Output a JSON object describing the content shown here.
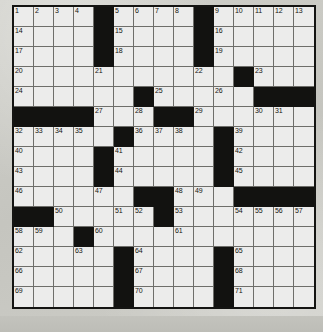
{
  "document": {
    "type": "crossword-puzzle-grid",
    "title": "Crossword Puzzle",
    "caption": ""
  },
  "grid": {
    "columns": 15,
    "rows": 15,
    "cell_size_px": 20,
    "colors": {
      "white_cell": "#ececeb",
      "black_cell": "#121210",
      "grid_line": "#6e6e6a",
      "border": "#141412",
      "number_text": "#15150f",
      "paper_background": "#c8c8c2"
    },
    "black_cells": [
      [
        0,
        4
      ],
      [
        0,
        9
      ],
      [
        1,
        4
      ],
      [
        1,
        9
      ],
      [
        2,
        4
      ],
      [
        2,
        9
      ],
      [
        3,
        11
      ],
      [
        4,
        6
      ],
      [
        4,
        12
      ],
      [
        4,
        13
      ],
      [
        4,
        14
      ],
      [
        5,
        0
      ],
      [
        5,
        1
      ],
      [
        5,
        2
      ],
      [
        5,
        3
      ],
      [
        5,
        7
      ],
      [
        5,
        8
      ],
      [
        6,
        5
      ],
      [
        6,
        10
      ],
      [
        7,
        4
      ],
      [
        7,
        10
      ],
      [
        8,
        4
      ],
      [
        8,
        10
      ],
      [
        9,
        6
      ],
      [
        9,
        7
      ],
      [
        9,
        11
      ],
      [
        9,
        12
      ],
      [
        9,
        13
      ],
      [
        9,
        14
      ],
      [
        10,
        0
      ],
      [
        10,
        1
      ],
      [
        10,
        7
      ],
      [
        11,
        3
      ],
      [
        12,
        5
      ],
      [
        12,
        10
      ],
      [
        13,
        5
      ],
      [
        13,
        10
      ],
      [
        14,
        5
      ],
      [
        14,
        10
      ]
    ],
    "numbered_cells": [
      {
        "number": 1,
        "row": 0,
        "col": 0
      },
      {
        "number": 2,
        "row": 0,
        "col": 1
      },
      {
        "number": 3,
        "row": 0,
        "col": 2
      },
      {
        "number": 4,
        "row": 0,
        "col": 3
      },
      {
        "number": 5,
        "row": 0,
        "col": 5
      },
      {
        "number": 6,
        "row": 0,
        "col": 6
      },
      {
        "number": 7,
        "row": 0,
        "col": 7
      },
      {
        "number": 8,
        "row": 0,
        "col": 8
      },
      {
        "number": 9,
        "row": 0,
        "col": 10
      },
      {
        "number": 10,
        "row": 0,
        "col": 11
      },
      {
        "number": 11,
        "row": 0,
        "col": 12
      },
      {
        "number": 12,
        "row": 0,
        "col": 13
      },
      {
        "number": 13,
        "row": 0,
        "col": 14
      },
      {
        "number": 14,
        "row": 1,
        "col": 0
      },
      {
        "number": 15,
        "row": 1,
        "col": 5
      },
      {
        "number": 16,
        "row": 1,
        "col": 10
      },
      {
        "number": 17,
        "row": 2,
        "col": 0
      },
      {
        "number": 18,
        "row": 2,
        "col": 5
      },
      {
        "number": 19,
        "row": 2,
        "col": 10
      },
      {
        "number": 20,
        "row": 3,
        "col": 0
      },
      {
        "number": 21,
        "row": 3,
        "col": 4
      },
      {
        "number": 22,
        "row": 3,
        "col": 9
      },
      {
        "number": 23,
        "row": 3,
        "col": 12
      },
      {
        "number": 24,
        "row": 4,
        "col": 0
      },
      {
        "number": 25,
        "row": 4,
        "col": 7
      },
      {
        "number": 26,
        "row": 4,
        "col": 10
      },
      {
        "number": 27,
        "row": 5,
        "col": 4
      },
      {
        "number": 28,
        "row": 5,
        "col": 6
      },
      {
        "number": 29,
        "row": 5,
        "col": 9
      },
      {
        "number": 30,
        "row": 5,
        "col": 12
      },
      {
        "number": 31,
        "row": 5,
        "col": 13
      },
      {
        "number": 32,
        "row": 6,
        "col": 0
      },
      {
        "number": 33,
        "row": 6,
        "col": 1
      },
      {
        "number": 34,
        "row": 6,
        "col": 2
      },
      {
        "number": 35,
        "row": 6,
        "col": 3
      },
      {
        "number": 36,
        "row": 6,
        "col": 6
      },
      {
        "number": 37,
        "row": 6,
        "col": 7
      },
      {
        "number": 38,
        "row": 6,
        "col": 8
      },
      {
        "number": 39,
        "row": 6,
        "col": 11
      },
      {
        "number": 40,
        "row": 7,
        "col": 0
      },
      {
        "number": 41,
        "row": 7,
        "col": 5
      },
      {
        "number": 42,
        "row": 7,
        "col": 11
      },
      {
        "number": 43,
        "row": 8,
        "col": 0
      },
      {
        "number": 44,
        "row": 8,
        "col": 5
      },
      {
        "number": 45,
        "row": 8,
        "col": 11
      },
      {
        "number": 46,
        "row": 9,
        "col": 0
      },
      {
        "number": 47,
        "row": 9,
        "col": 4
      },
      {
        "number": 48,
        "row": 9,
        "col": 8
      },
      {
        "number": 49,
        "row": 9,
        "col": 9
      },
      {
        "number": 50,
        "row": 10,
        "col": 2
      },
      {
        "number": 51,
        "row": 10,
        "col": 5
      },
      {
        "number": 52,
        "row": 10,
        "col": 6
      },
      {
        "number": 53,
        "row": 10,
        "col": 8
      },
      {
        "number": 54,
        "row": 10,
        "col": 11
      },
      {
        "number": 55,
        "row": 10,
        "col": 12
      },
      {
        "number": 56,
        "row": 10,
        "col": 13
      },
      {
        "number": 57,
        "row": 10,
        "col": 14
      },
      {
        "number": 58,
        "row": 11,
        "col": 0
      },
      {
        "number": 59,
        "row": 11,
        "col": 1
      },
      {
        "number": 60,
        "row": 11,
        "col": 4
      },
      {
        "number": 61,
        "row": 11,
        "col": 8
      },
      {
        "number": 62,
        "row": 12,
        "col": 0
      },
      {
        "number": 63,
        "row": 12,
        "col": 3
      },
      {
        "number": 64,
        "row": 12,
        "col": 6
      },
      {
        "number": 65,
        "row": 12,
        "col": 11
      },
      {
        "number": 66,
        "row": 13,
        "col": 0
      },
      {
        "number": 67,
        "row": 13,
        "col": 6
      },
      {
        "number": 68,
        "row": 13,
        "col": 11
      },
      {
        "number": 69,
        "row": 14,
        "col": 0
      },
      {
        "number": 70,
        "row": 14,
        "col": 6
      },
      {
        "number": 71,
        "row": 14,
        "col": 11
      }
    ]
  }
}
